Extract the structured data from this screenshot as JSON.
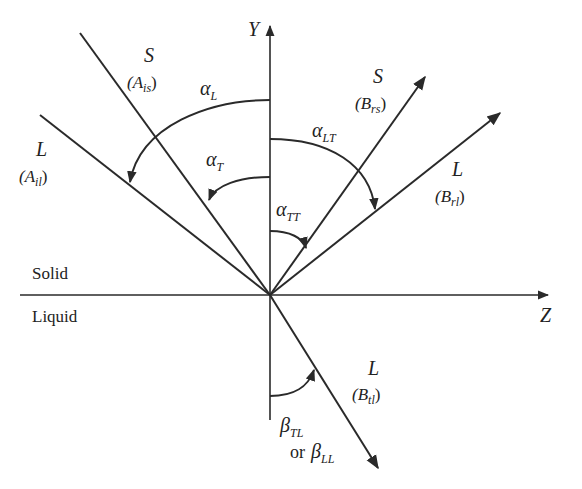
{
  "diagram": {
    "axes": {
      "y_label": "Y",
      "z_label": "Z"
    },
    "regions": {
      "upper": "Solid",
      "lower": "Liquid"
    },
    "waves": {
      "incident_shear": {
        "mode": "S",
        "name": "(A",
        "sub": "is",
        "close": ")"
      },
      "incident_long": {
        "mode": "L",
        "name": "(A",
        "sub": "il",
        "close": ")"
      },
      "reflected_shear": {
        "mode": "S",
        "name": "(B",
        "sub": "rs",
        "close": ")"
      },
      "reflected_long": {
        "mode": "L",
        "name": "(B",
        "sub": "rl",
        "close": ")"
      },
      "transmitted_long": {
        "mode": "L",
        "name": "(B",
        "sub": "tl",
        "close": ")"
      }
    },
    "angles": {
      "alpha_L": {
        "sym": "α",
        "sub": "L"
      },
      "alpha_T": {
        "sym": "α",
        "sub": "T"
      },
      "alpha_LT": {
        "sym": "α",
        "sub": "LT"
      },
      "alpha_TT": {
        "sym": "α",
        "sub": "TT"
      },
      "beta_TL": {
        "sym": "β",
        "sub": "TL"
      },
      "beta_or": "or",
      "beta_LL": {
        "sym": "β",
        "sub": "LL"
      }
    },
    "colors": {
      "ink": "#2a2a2a",
      "background": "#ffffff"
    }
  }
}
